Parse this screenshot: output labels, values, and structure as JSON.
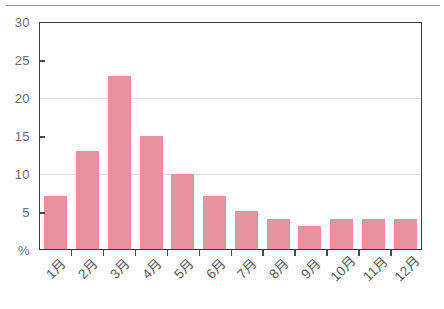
{
  "figure": {
    "background_color": "#ffffff",
    "bar_color": "#e8929f",
    "axis_color": "#3c3c3c",
    "gridline_color": "#e9dfe2",
    "tick_label_color": "#6e6e6e",
    "has_top_rule": true
  },
  "chart_data": {
    "type": "bar",
    "title": "",
    "xlabel": "",
    "ylabel": "%",
    "categories": [
      "1月",
      "2月",
      "3月",
      "4月",
      "5月",
      "6月",
      "7月",
      "8月",
      "9月",
      "10月",
      "11月",
      "12月"
    ],
    "values": [
      7,
      13,
      23,
      15,
      10,
      7,
      5,
      4,
      3,
      4,
      4,
      4
    ],
    "ylim": [
      0,
      30
    ],
    "ytick_labels": [
      "30",
      "25",
      "20",
      "15",
      "10",
      "5",
      "%"
    ],
    "ytick_values": [
      30,
      25,
      20,
      15,
      10,
      5,
      0
    ],
    "gridlines_at": [
      10,
      20
    ],
    "grid": true,
    "legend": null,
    "series": [
      {
        "name": "",
        "values": [
          7,
          13,
          23,
          15,
          10,
          7,
          5,
          4,
          3,
          4,
          4,
          4
        ],
        "color": "#e8929f"
      }
    ]
  }
}
